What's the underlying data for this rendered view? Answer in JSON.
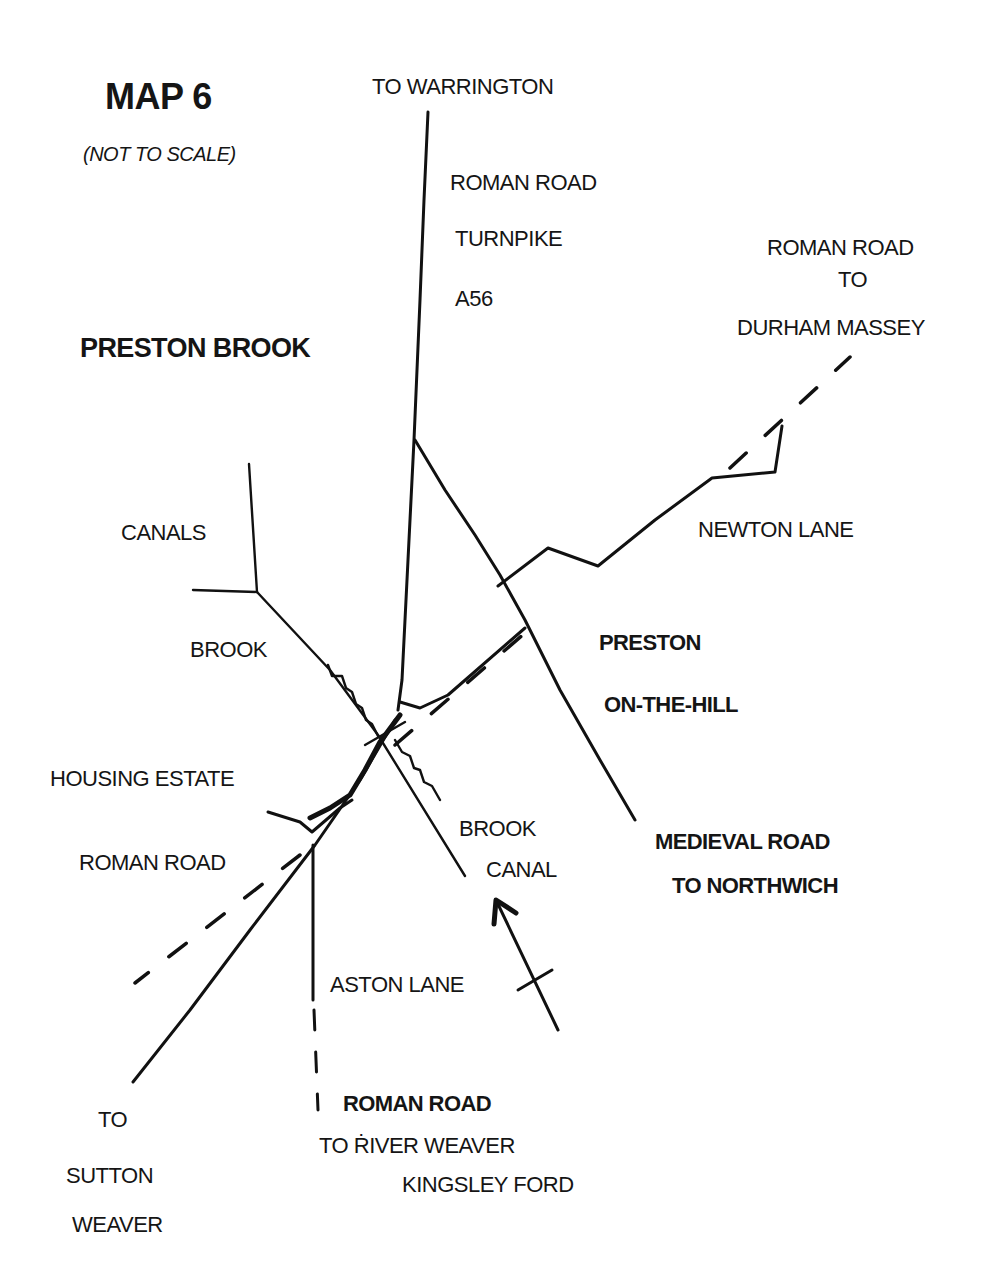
{
  "map": {
    "title": "MAP 6",
    "subtitle": "(NOT TO SCALE)",
    "place_name": "PRESTON BROOK"
  },
  "labels": {
    "to_warrington": "TO WARRINGTON",
    "roman_road_north": "ROMAN ROAD",
    "turnpike": "TURNPIKE",
    "a56": "A56",
    "roman_road_ne_1": "ROMAN ROAD",
    "roman_road_ne_2": "TO",
    "roman_road_ne_3": "DURHAM MASSEY",
    "canals": "CANALS",
    "newton_lane": "NEWTON LANE",
    "brook_west": "BROOK",
    "preston": "PRESTON",
    "on_the_hill": "ON-THE-HILL",
    "housing_estate": "HOUSING ESTATE",
    "roman_road_west": "ROMAN ROAD",
    "brook_south": "BROOK",
    "canal_south": "CANAL",
    "medieval_road_1": "MEDIEVAL ROAD",
    "medieval_road_2": "TO NORTHWICH",
    "aston_lane": "ASTON LANE",
    "roman_road_south_1": "ROMAN ROAD",
    "roman_road_south_2": "TO ṘIVER WEAVER",
    "roman_road_south_3": "KINGSLEY FORD",
    "sutton_1": "TO",
    "sutton_2": "SUTTON",
    "sutton_3": "WEAVER"
  },
  "legend": {
    "solid_line": "road / canal",
    "dashed_line": "Roman road (conjectured)",
    "wavy_line": "brook",
    "arrow": "direction indicator",
    "ink_color": "#111111",
    "background": "#ffffff"
  }
}
